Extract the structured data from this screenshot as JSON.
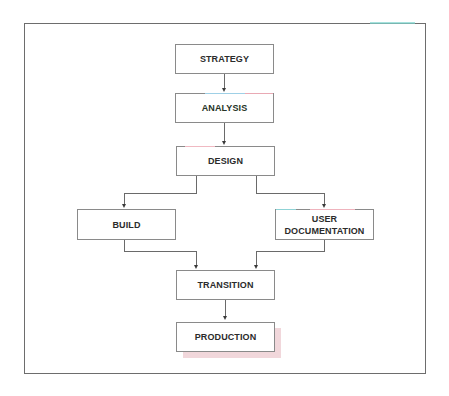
{
  "diagram": {
    "type": "flowchart",
    "nodes": {
      "strategy": "STRATEGY",
      "analysis": "ANALYSIS",
      "design": "DESIGN",
      "build": "BUILD",
      "user_documentation_line1": "USER",
      "user_documentation_line2": "DOCUMENTATION",
      "transition": "TRANSITION",
      "production": "PRODUCTION"
    },
    "edges": [
      {
        "from": "STRATEGY",
        "to": "ANALYSIS"
      },
      {
        "from": "ANALYSIS",
        "to": "DESIGN"
      },
      {
        "from": "DESIGN",
        "to": "BUILD"
      },
      {
        "from": "DESIGN",
        "to": "USER DOCUMENTATION"
      },
      {
        "from": "BUILD",
        "to": "TRANSITION"
      },
      {
        "from": "USER DOCUMENTATION",
        "to": "TRANSITION"
      },
      {
        "from": "TRANSITION",
        "to": "PRODUCTION"
      }
    ],
    "colors": {
      "border": "#8a8a8a",
      "text": "#2b2b2b",
      "production_shadow": "#f1d7db",
      "frame": "#6d6d6d"
    }
  }
}
